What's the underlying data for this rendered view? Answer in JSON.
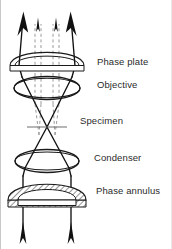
{
  "figure": {
    "background_color": "#ffffff",
    "line_color": "#1a1a1a",
    "dashed_ray_color": "#9a9a9a",
    "hatch_color": "#3a3a3a",
    "label_color": "#2b2b2b"
  },
  "labels": [
    {
      "id": "phase-plate",
      "text": "Phase plate",
      "x": 96,
      "y": 62
    },
    {
      "id": "objective",
      "text": "Objective",
      "x": 96,
      "y": 85
    },
    {
      "id": "specimen",
      "text": "Specimen",
      "x": 79,
      "y": 121
    },
    {
      "id": "condenser",
      "text": "Condenser",
      "x": 93,
      "y": 158
    },
    {
      "id": "phase-annulus",
      "text": "Phase annulus",
      "x": 95,
      "y": 191
    }
  ],
  "components": {
    "phase_plate": {
      "label": "Phase plate",
      "center_x": 46,
      "y": 62,
      "width": 74
    },
    "objective": {
      "label": "Objective",
      "center_x": 46,
      "y": 88,
      "width": 66
    },
    "specimen": {
      "label": "Specimen",
      "center_x": 46,
      "y": 127,
      "width": 40
    },
    "condenser": {
      "label": "Condenser",
      "center_x": 46,
      "y": 160,
      "width": 70
    },
    "phase_annulus": {
      "label": "Phase annulus",
      "center_x": 46,
      "y": 198,
      "width": 78,
      "fill": "hatched"
    }
  },
  "rays": {
    "diffracted_label": "diffracted light",
    "diffracted_style": "solid",
    "undiffracted_label": "undiffracted light",
    "undiffracted_style": "dashed",
    "top_arrow_count": 4,
    "bottom_arrow_count": 2
  }
}
